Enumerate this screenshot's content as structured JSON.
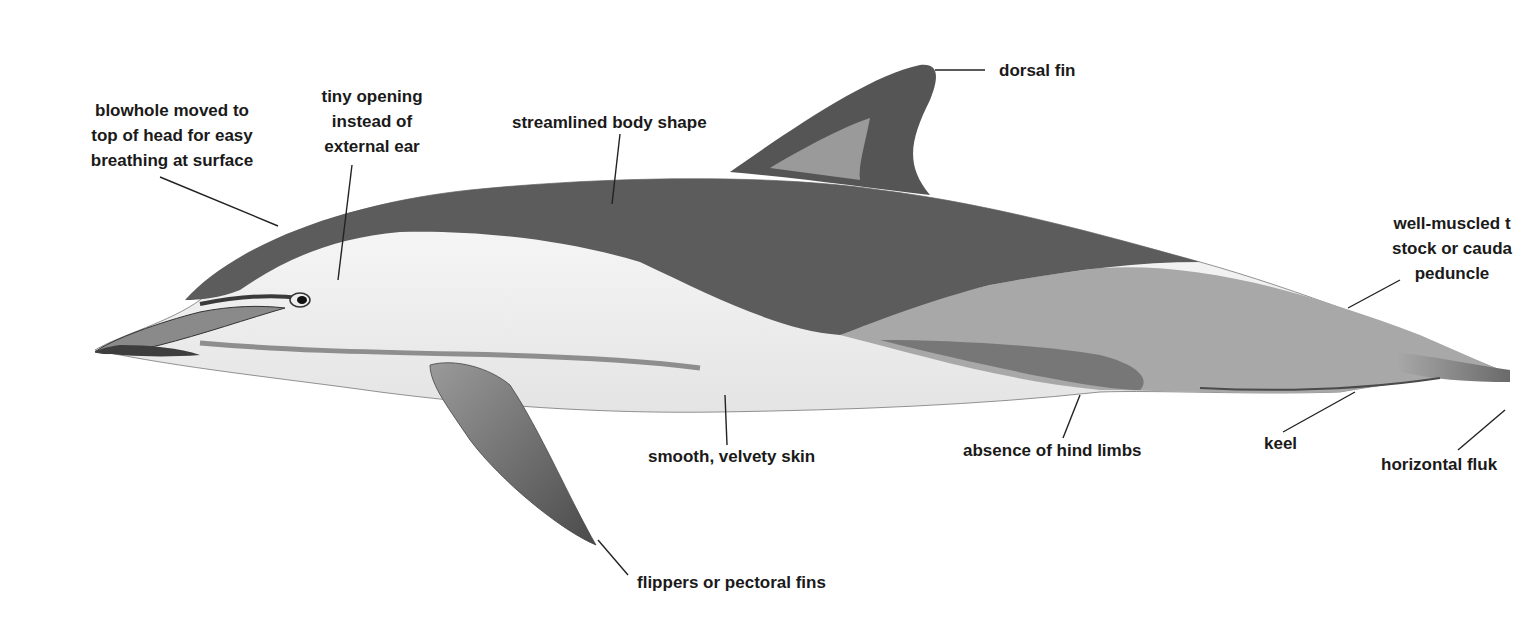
{
  "diagram": {
    "labels": [
      {
        "id": "blowhole",
        "lines": [
          "blowhole moved to",
          "top of head for easy",
          "breathing at surface"
        ]
      },
      {
        "id": "ear",
        "lines": [
          "tiny opening",
          "instead of",
          "external ear"
        ]
      },
      {
        "id": "streamlined",
        "lines": [
          "streamlined body shape"
        ]
      },
      {
        "id": "dorsal",
        "lines": [
          "dorsal fin"
        ]
      },
      {
        "id": "tailstock",
        "lines": [
          "well-muscled t",
          "stock or cauda",
          "peduncle"
        ]
      },
      {
        "id": "skin",
        "lines": [
          "smooth, velvety skin"
        ]
      },
      {
        "id": "hindlimbs",
        "lines": [
          "absence of hind limbs"
        ]
      },
      {
        "id": "keel",
        "lines": [
          "keel"
        ]
      },
      {
        "id": "flukes",
        "lines": [
          "horizontal fluk"
        ]
      },
      {
        "id": "flippers",
        "lines": [
          "flippers or pectoral fins"
        ]
      }
    ],
    "colors": {
      "background": "#ffffff",
      "dark_back": "#5a5a5a",
      "mid_grey": "#8c8c8c",
      "light_flank": "#a8a8a8",
      "belly": "#f2f2f2",
      "leader_line": "#222222",
      "text": "#1a1a1a"
    }
  }
}
